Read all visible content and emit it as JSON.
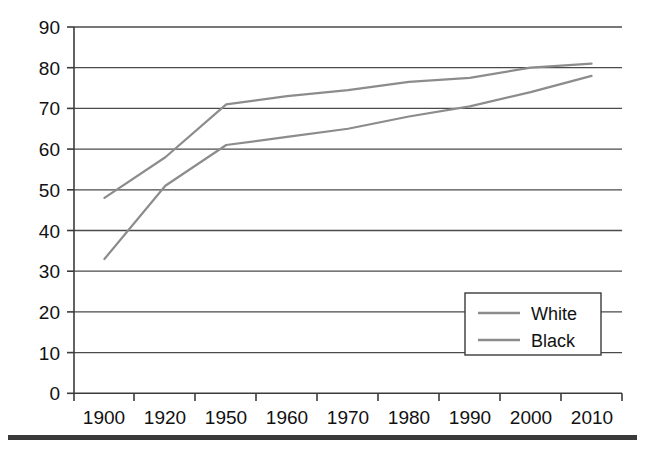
{
  "chart_data": {
    "type": "line",
    "title": "",
    "subtitle": "",
    "xlabel": "",
    "ylabel": "",
    "categories": [
      "1900",
      "1920",
      "1950",
      "1960",
      "1970",
      "1980",
      "1990",
      "2000",
      "2010"
    ],
    "x": [
      1900,
      1920,
      1950,
      1960,
      1970,
      1980,
      1990,
      2000,
      2010
    ],
    "series": [
      {
        "name": "White",
        "color": "#8c8c8c",
        "values": [
          48,
          58,
          71,
          73,
          74.5,
          76.5,
          77.5,
          80,
          81
        ]
      },
      {
        "name": "Black",
        "color": "#8c8c8c",
        "values": [
          33,
          51,
          61,
          63,
          65,
          68,
          70.5,
          74,
          78
        ]
      }
    ],
    "ylim": [
      0,
      90
    ],
    "yticks": [
      0,
      10,
      20,
      30,
      40,
      50,
      60,
      70,
      80,
      90
    ],
    "ytick_labels": [
      "0",
      "10",
      "20",
      "30",
      "40",
      "50",
      "60",
      "70",
      "80",
      "90"
    ],
    "xtick_labels": [
      "1900",
      "1920",
      "1950",
      "1960",
      "1970",
      "1980",
      "1990",
      "2000",
      "2010"
    ],
    "grid": "horizontal",
    "legend_position": "bottom-right",
    "legend_entries": [
      "White",
      "Black"
    ],
    "axis_color": "#3b3b3b",
    "grid_color": "#4a4a4a",
    "background": "#ffffff"
  }
}
